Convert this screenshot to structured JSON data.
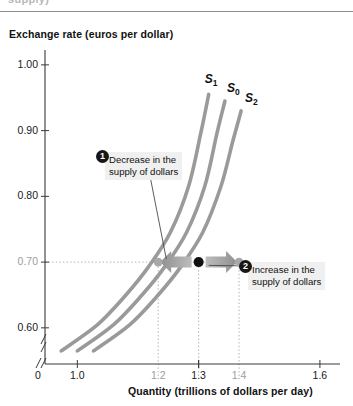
{
  "figure": {
    "clipped_top_text": "supply)",
    "y_axis_title": "Exchange rate (euros per dollar)",
    "x_axis_title": "Quantity (trillions of dollars per day)"
  },
  "chart_data": {
    "type": "line",
    "title": "",
    "xlabel": "Quantity (trillions of dollars per day)",
    "ylabel": "Exchange rate (euros per dollar)",
    "xlim": [
      0.92,
      1.62
    ],
    "ylim": [
      0.545,
      1.015
    ],
    "grid": "dotted-guides-only",
    "legend": "inline-curve-labels",
    "x_ticks": [
      {
        "value": 0,
        "label": "0",
        "muted": false
      },
      {
        "value": 1.0,
        "label": "1.0",
        "muted": false
      },
      {
        "value": 1.2,
        "label": "1.2",
        "muted": true
      },
      {
        "value": 1.3,
        "label": "1.3",
        "muted": false
      },
      {
        "value": 1.4,
        "label": "1.4",
        "muted": true
      },
      {
        "value": 1.6,
        "label": "1.6",
        "muted": false
      }
    ],
    "y_ticks": [
      {
        "value": 1.0,
        "label": "1.00",
        "muted": false
      },
      {
        "value": 0.9,
        "label": "0.90",
        "muted": false
      },
      {
        "value": 0.8,
        "label": "0.80",
        "muted": false
      },
      {
        "value": 0.7,
        "label": "0.70",
        "muted": true
      },
      {
        "value": 0.6,
        "label": "0.60",
        "muted": false
      }
    ],
    "axis_breaks": [
      "x-axis-near-origin",
      "y-axis-near-origin"
    ],
    "series": [
      {
        "name": "S1",
        "label": "S",
        "subscript": "1",
        "color": "#9a9a9a",
        "role": "decreased-supply",
        "points": [
          [
            0.96,
            0.565
          ],
          [
            1.05,
            0.605
          ],
          [
            1.12,
            0.65
          ],
          [
            1.175,
            0.692
          ],
          [
            1.23,
            0.745
          ],
          [
            1.275,
            0.815
          ],
          [
            1.305,
            0.895
          ],
          [
            1.325,
            0.955
          ]
        ]
      },
      {
        "name": "S0",
        "label": "S",
        "subscript": "0",
        "color": "#9a9a9a",
        "role": "original-supply",
        "points": [
          [
            1.0,
            0.565
          ],
          [
            1.09,
            0.605
          ],
          [
            1.16,
            0.65
          ],
          [
            1.215,
            0.692
          ],
          [
            1.27,
            0.745
          ],
          [
            1.315,
            0.815
          ],
          [
            1.345,
            0.895
          ],
          [
            1.365,
            0.945
          ]
        ]
      },
      {
        "name": "S2",
        "label": "S",
        "subscript": "2",
        "color": "#9a9a9a",
        "role": "increased-supply",
        "points": [
          [
            1.04,
            0.565
          ],
          [
            1.13,
            0.605
          ],
          [
            1.2,
            0.65
          ],
          [
            1.255,
            0.692
          ],
          [
            1.31,
            0.745
          ],
          [
            1.355,
            0.815
          ],
          [
            1.385,
            0.885
          ],
          [
            1.405,
            0.93
          ]
        ]
      }
    ],
    "points_of_interest": [
      {
        "name": "equilibrium-original",
        "x": 1.3,
        "y": 0.7,
        "style": "filled-black-dot"
      },
      {
        "name": "point-on-S1",
        "x": 1.2,
        "y": 0.7,
        "style": "filled-gray-dot"
      },
      {
        "name": "point-on-S2",
        "x": 1.4,
        "y": 0.7,
        "style": "filled-gray-dot"
      }
    ],
    "guides": [
      {
        "orientation": "horizontal",
        "value": 0.7,
        "from_x": 0.92,
        "to_x": 1.4
      },
      {
        "orientation": "vertical",
        "value": 1.2,
        "from_y": 0.545,
        "to_y": 0.7
      },
      {
        "orientation": "vertical",
        "value": 1.3,
        "from_y": 0.545,
        "to_y": 0.7
      },
      {
        "orientation": "vertical",
        "value": 1.4,
        "from_y": 0.545,
        "to_y": 0.7
      }
    ],
    "shift_arrows": [
      {
        "name": "leftward-shift-arrow",
        "direction": "left",
        "from_x": 1.3,
        "to_x": 1.205,
        "y": 0.7,
        "color": "#9e9e9e"
      },
      {
        "name": "rightward-shift-arrow",
        "direction": "right",
        "from_x": 1.3,
        "to_x": 1.395,
        "y": 0.7,
        "color": "#9e9e9e"
      }
    ],
    "annotations": [
      {
        "id": "1",
        "line1": "Decrease in the",
        "line2": "supply of dollars",
        "badge": "1",
        "target": {
          "x": 1.22,
          "y": 0.705
        }
      },
      {
        "id": "2",
        "line1": "Increase in the",
        "line2": "supply of dollars",
        "badge": "2",
        "target": {
          "x": 1.325,
          "y": 0.695
        }
      }
    ]
  }
}
